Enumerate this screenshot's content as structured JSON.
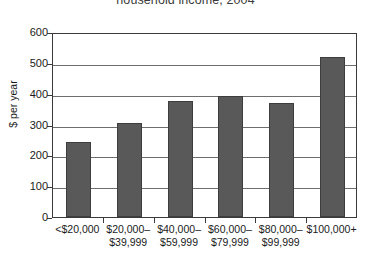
{
  "chart_data": {
    "type": "bar",
    "title": "household income, 2004",
    "xlabel": "",
    "ylabel": "$ per year",
    "categories": [
      "<$20,000",
      "$20,000–\n$39,999",
      "$40,000–\n$59,999",
      "$60,000–\n$79,999",
      "$80,000–\n$99,999",
      "$100,000+"
    ],
    "values": [
      243,
      306,
      376,
      393,
      369,
      520
    ],
    "ylim": [
      0,
      600
    ],
    "ytick_labels": [
      "600",
      "500",
      "400",
      "300",
      "200",
      "100",
      "0"
    ],
    "ytick_values": [
      600,
      500,
      400,
      300,
      200,
      100,
      0
    ],
    "grid": true,
    "legend": "none",
    "bar_color": "#595959",
    "bar_edge_color": "#3d3d3d",
    "axis_color": "#3a3a3a",
    "grid_color": "#6e6e6e",
    "background_color": "#ffffff"
  }
}
